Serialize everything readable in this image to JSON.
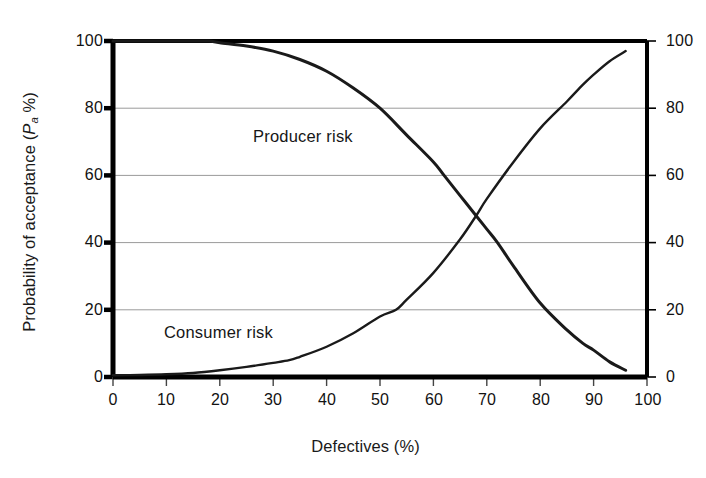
{
  "chart_data": {
    "type": "line",
    "title": "",
    "subtitle": "",
    "xlabel": "Defectives (%)",
    "ylabel": "Probability of acceptance (P_a %)",
    "ylabel_parts": {
      "prefix": "Probability of acceptance (",
      "symbol": "P",
      "subscript": "a",
      "suffix": " %)"
    },
    "ylabel_right": "Probability of acceptance (Pa %)",
    "xlim": [
      0,
      100
    ],
    "ylim": [
      0,
      100
    ],
    "xticks": [
      0,
      10,
      20,
      30,
      40,
      50,
      60,
      70,
      80,
      90,
      100
    ],
    "xticklabels": [
      "0",
      "10",
      "20",
      "30",
      "40",
      "50",
      "60",
      "70",
      "80",
      "90",
      "100"
    ],
    "yticks": [
      0,
      20,
      40,
      60,
      80,
      100
    ],
    "yticklabels": [
      "0",
      "20",
      "40",
      "60",
      "80",
      "100"
    ],
    "yticks_right": [
      0,
      20,
      40,
      60,
      80,
      100
    ],
    "yticklabels_right": [
      "0",
      "20",
      "40",
      "60",
      "80",
      "100"
    ],
    "grid": "horizontal",
    "grid_color": "#9a9a9a",
    "legend": "none",
    "frame_color": "#000000",
    "curve_color": "#1a1a1a",
    "background": "#ffffff",
    "annotations": [
      {
        "text": "Producer risk",
        "x": 26,
        "y": 72
      },
      {
        "text": "Consumer risk",
        "x": 10,
        "y": 14
      }
    ],
    "series": [
      {
        "name": "Producer risk",
        "description": "Operating characteristic curve: probability of acceptance falls as defectives increase",
        "x": [
          0,
          5,
          10,
          15,
          18,
          20,
          25,
          30,
          35,
          40,
          45,
          50,
          55,
          60,
          62,
          65,
          68,
          70,
          72,
          75,
          80,
          85,
          88,
          90,
          93,
          96
        ],
        "y": [
          100,
          100,
          100,
          100,
          100,
          99.5,
          98.5,
          97,
          94.5,
          91,
          86,
          80,
          72,
          64,
          60,
          54,
          48,
          44,
          40,
          33,
          22,
          14,
          10,
          8,
          4.5,
          2
        ]
      },
      {
        "name": "Consumer risk",
        "description": "Complementary curve: probability of rejection risk rises as defectives increase",
        "x": [
          0,
          5,
          10,
          15,
          20,
          25,
          30,
          33,
          35,
          40,
          45,
          50,
          53,
          55,
          60,
          65,
          68,
          70,
          75,
          80,
          85,
          88,
          90,
          93,
          96
        ],
        "y": [
          0.5,
          0.6,
          0.8,
          1.2,
          2,
          3,
          4.2,
          5,
          6,
          9,
          13,
          18,
          20,
          23,
          31,
          41,
          48,
          53,
          64,
          74,
          82,
          87,
          90,
          94,
          97
        ]
      }
    ],
    "crossing_point": {
      "x": 68,
      "y": 48
    }
  },
  "axes": {
    "x_tick_labels": [
      "0",
      "10",
      "20",
      "30",
      "40",
      "50",
      "60",
      "70",
      "80",
      "90",
      "100"
    ],
    "y_left_tick_labels": [
      "100",
      "80",
      "60",
      "40",
      "20",
      "0"
    ],
    "y_right_tick_labels": [
      "100",
      "80",
      "60",
      "40",
      "20",
      "0"
    ]
  },
  "labels": {
    "x_title": "Defectives (%)",
    "y_title_prefix": "Probability of acceptance (",
    "y_title_symbol": "P",
    "y_title_subscript": "a",
    "y_title_suffix": " %)",
    "producer_risk": "Producer risk",
    "consumer_risk": "Consumer risk"
  }
}
